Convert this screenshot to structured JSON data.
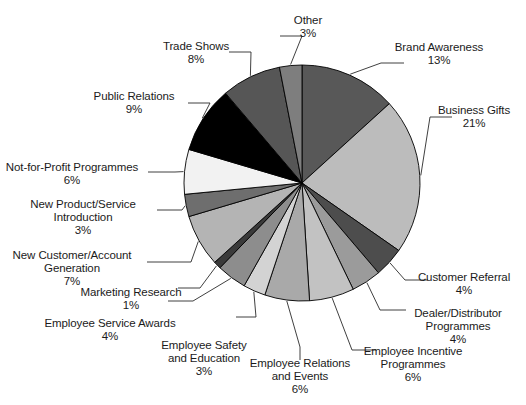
{
  "chart_data": {
    "type": "pie",
    "title": "",
    "subtitle": "",
    "xlabel": "",
    "ylabel": "",
    "legend_position": "none",
    "grid": false,
    "labels_show_percent": true,
    "start_angle_deg": 0,
    "direction": "clockwise",
    "total": 100,
    "unit": "%",
    "categories": [
      "Brand Awareness",
      "Business Gifts",
      "Customer Referral",
      "Dealer/Distributor Programmes",
      "Employee Incentive Programmes",
      "Employee Relations and Events",
      "Employee Safety and Education",
      "Employee Service Awards",
      "Marketing Research",
      "New Customer/Account Generation",
      "New Product/Service Introduction",
      "Not-for-Profit Programmes",
      "Public Relations",
      "Trade Shows",
      "Other"
    ],
    "values": [
      13,
      21,
      4,
      4,
      6,
      6,
      3,
      4,
      1,
      7,
      3,
      6,
      9,
      8,
      3
    ],
    "colors": [
      "#585858",
      "#bcbcbc",
      "#4d4d4d",
      "#9b9b9b",
      "#c2c2c2",
      "#a9a9a9",
      "#d3d3d3",
      "#8d8d8d",
      "#3a3a3a",
      "#b4b4b4",
      "#6e6e6e",
      "#f2f2f2",
      "#000000",
      "#565656",
      "#7e7e7e"
    ],
    "slice_border_color": "#000000",
    "background": "#ffffff"
  },
  "labels": [
    {
      "name": "other",
      "line1": "Other",
      "line2": "",
      "pct": "3%"
    },
    {
      "name": "brand-awareness",
      "line1": "Brand Awareness",
      "line2": "",
      "pct": "13%"
    },
    {
      "name": "business-gifts",
      "line1": "Business Gifts",
      "line2": "",
      "pct": "21%"
    },
    {
      "name": "customer-referral",
      "line1": "Customer Referral",
      "line2": "",
      "pct": "4%"
    },
    {
      "name": "dealer-distributor",
      "line1": "Dealer/Distributor",
      "line2": "Programmes",
      "pct": "4%"
    },
    {
      "name": "employee-incentive",
      "line1": "Employee Incentive",
      "line2": "Programmes",
      "pct": "6%"
    },
    {
      "name": "employee-relations",
      "line1": "Employee Relations",
      "line2": "and Events",
      "pct": "6%"
    },
    {
      "name": "employee-safety",
      "line1": "Employee Safety",
      "line2": "and Education",
      "pct": "3%"
    },
    {
      "name": "employee-service-awards",
      "line1": "Employee Service Awards",
      "line2": "",
      "pct": "4%"
    },
    {
      "name": "marketing-research",
      "line1": "Marketing Research",
      "line2": "",
      "pct": "1%"
    },
    {
      "name": "new-customer-account",
      "line1": "New Customer/Account",
      "line2": "Generation",
      "pct": "7%"
    },
    {
      "name": "new-product-service",
      "line1": "New Product/Service",
      "line2": "Introduction",
      "pct": "3%"
    },
    {
      "name": "not-for-profit",
      "line1": "Not-for-Profit Programmes",
      "line2": "",
      "pct": "6%"
    },
    {
      "name": "public-relations",
      "line1": "Public Relations",
      "line2": "",
      "pct": "9%"
    },
    {
      "name": "trade-shows",
      "line1": "Trade Shows",
      "line2": "",
      "pct": "8%"
    }
  ]
}
